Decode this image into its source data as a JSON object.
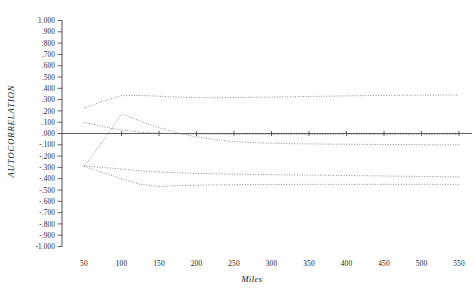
{
  "chart_data": {
    "type": "line",
    "title": "",
    "xlabel": "Miles",
    "ylabel": "AUTOCORRELATION",
    "xlim": [
      35,
      560
    ],
    "ylim": [
      -1.0,
      1.0
    ],
    "grid": false,
    "legend": "none",
    "x_ticks": [
      50,
      100,
      150,
      200,
      250,
      300,
      350,
      400,
      450,
      500,
      550
    ],
    "x_tick_labels": [
      "50",
      "100",
      "150",
      "200",
      "250",
      "300",
      "350",
      "400",
      "450",
      "500",
      "550"
    ],
    "y_ticks": [
      1.0,
      0.9,
      0.8,
      0.7,
      0.6,
      0.5,
      0.4,
      0.3,
      0.2,
      0.1,
      0.0,
      -0.1,
      -0.2,
      -0.3,
      -0.4,
      -0.5,
      -0.6,
      -0.7,
      -0.8,
      -0.9,
      -1.0
    ],
    "y_tick_labels": [
      "1.000",
      ".900",
      ".800",
      ".700",
      ".600",
      ".500",
      ".400",
      ".300",
      ".200",
      ".100",
      ".000",
      "-.100",
      "-.200",
      "-.300",
      "-.400",
      "-.500",
      "-.600",
      "-.700",
      "-.800",
      "-.900",
      "-1.000"
    ],
    "zero_reference_line": 0.0,
    "x": [
      50,
      75,
      100,
      125,
      150,
      175,
      200,
      225,
      250,
      275,
      300,
      325,
      350,
      375,
      400,
      425,
      450,
      475,
      500,
      525,
      550
    ],
    "series": [
      {
        "name": "upper-confidence-band",
        "style": "dotted",
        "values": [
          0.225,
          0.285,
          0.335,
          0.337,
          0.33,
          0.322,
          0.318,
          0.316,
          0.318,
          0.32,
          0.322,
          0.325,
          0.328,
          0.33,
          0.333,
          0.335,
          0.337,
          0.338,
          0.339,
          0.34,
          0.341
        ]
      },
      {
        "name": "upper-inner-band",
        "style": "dotted",
        "values": [
          0.098,
          0.062,
          0.03,
          0.012,
          0.002,
          -0.002,
          -0.005,
          -0.006,
          -0.007,
          -0.007,
          -0.008,
          -0.008,
          -0.008,
          -0.008,
          -0.008,
          -0.008,
          -0.008,
          -0.008,
          -0.008,
          -0.008,
          -0.008
        ]
      },
      {
        "name": "autocorrelation-series",
        "style": "dotted",
        "values": [
          -0.295,
          -0.07,
          0.175,
          0.11,
          0.05,
          0.005,
          -0.03,
          -0.055,
          -0.072,
          -0.08,
          -0.086,
          -0.09,
          -0.092,
          -0.094,
          -0.095,
          -0.096,
          -0.097,
          -0.098,
          -0.099,
          -0.1,
          -0.1
        ]
      },
      {
        "name": "lower-inner-band",
        "style": "dotted",
        "values": [
          -0.285,
          -0.3,
          -0.315,
          -0.33,
          -0.34,
          -0.348,
          -0.353,
          -0.357,
          -0.36,
          -0.362,
          -0.364,
          -0.366,
          -0.368,
          -0.37,
          -0.372,
          -0.374,
          -0.376,
          -0.378,
          -0.38,
          -0.382,
          -0.384
        ]
      },
      {
        "name": "lower-confidence-band",
        "style": "dotted",
        "values": [
          -0.29,
          -0.345,
          -0.4,
          -0.45,
          -0.468,
          -0.462,
          -0.458,
          -0.455,
          -0.453,
          -0.452,
          -0.451,
          -0.45,
          -0.45,
          -0.45,
          -0.45,
          -0.45,
          -0.45,
          -0.45,
          -0.45,
          -0.45,
          -0.45
        ]
      }
    ],
    "zero_line_tick_x": [
      100,
      150,
      200,
      250,
      300,
      350,
      400,
      450,
      500,
      550
    ]
  },
  "colors": {
    "axis": "#3a3a3a",
    "series": "#6d6d6d",
    "zero_line": "#4a4a4a",
    "text": "#1b1b1b",
    "background": "#ffffff"
  }
}
